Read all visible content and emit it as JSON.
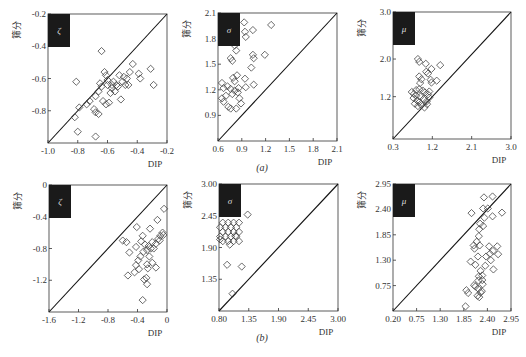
{
  "figure": {
    "row_labels": [
      "(a)",
      "(b)"
    ],
    "y_label": "筛分",
    "x_label": "DIP",
    "colors": {
      "axis": "#333333",
      "marker": "#444444",
      "badge": "#1a1a1a",
      "badge_text": "#dddddd",
      "diagonal": "#111111"
    }
  },
  "chart_data": [
    {
      "type": "scatter",
      "row": "a",
      "param": "ζ",
      "title": "ζ",
      "xlabel": "DIP",
      "ylabel": "筛分",
      "xlim": [
        -1.0,
        -0.2
      ],
      "ylim": [
        -1.0,
        -0.2
      ],
      "xticks": [
        "-1.0",
        "-0.8",
        "-0.6",
        "-0.4",
        "-0.2"
      ],
      "yticks": [
        "-0.2",
        "-0.4",
        "-0.6",
        "-0.8"
      ],
      "ytick_values": [
        -0.2,
        -0.4,
        -0.6,
        -0.8
      ],
      "xtick_values": [
        -1.0,
        -0.8,
        -0.6,
        -0.4,
        -0.2
      ],
      "diagonal": true,
      "frame": {
        "x": 48,
        "y": 14,
        "w": 119,
        "h": 129
      },
      "points": [
        [
          -0.81,
          -0.62
        ],
        [
          -0.64,
          -0.43
        ],
        [
          -0.82,
          -0.84
        ],
        [
          -0.79,
          -0.78
        ],
        [
          -0.8,
          -0.93
        ],
        [
          -0.74,
          -0.76
        ],
        [
          -0.72,
          -0.74
        ],
        [
          -0.69,
          -0.79
        ],
        [
          -0.68,
          -0.81
        ],
        [
          -0.66,
          -0.82
        ],
        [
          -0.68,
          -0.96
        ],
        [
          -0.68,
          -0.71
        ],
        [
          -0.66,
          -0.68
        ],
        [
          -0.65,
          -0.63
        ],
        [
          -0.64,
          -0.65
        ],
        [
          -0.63,
          -0.74
        ],
        [
          -0.62,
          -0.56
        ],
        [
          -0.61,
          -0.58
        ],
        [
          -0.6,
          -0.61
        ],
        [
          -0.6,
          -0.64
        ],
        [
          -0.59,
          -0.75
        ],
        [
          -0.61,
          -0.76
        ],
        [
          -0.58,
          -0.69
        ],
        [
          -0.57,
          -0.66
        ],
        [
          -0.56,
          -0.62
        ],
        [
          -0.55,
          -0.68
        ],
        [
          -0.54,
          -0.64
        ],
        [
          -0.52,
          -0.58
        ],
        [
          -0.51,
          -0.73
        ],
        [
          -0.5,
          -0.62
        ],
        [
          -0.49,
          -0.59
        ],
        [
          -0.48,
          -0.64
        ],
        [
          -0.47,
          -0.6
        ],
        [
          -0.46,
          -0.64
        ],
        [
          -0.45,
          -0.56
        ],
        [
          -0.43,
          -0.51
        ],
        [
          -0.39,
          -0.57
        ],
        [
          -0.38,
          -0.6
        ],
        [
          -0.31,
          -0.54
        ],
        [
          -0.29,
          -0.64
        ],
        [
          -0.57,
          -0.64
        ],
        [
          -0.53,
          -0.65
        ]
      ]
    },
    {
      "type": "scatter",
      "row": "a",
      "param": "σ",
      "title": "σ",
      "xlabel": "DIP",
      "ylabel": "筛分",
      "xlim": [
        0.6,
        2.1
      ],
      "ylim": [
        0.6,
        2.1
      ],
      "xticks": [
        "0.6",
        "0.9",
        "1.2",
        "1.5",
        "1.8",
        "2.1"
      ],
      "yticks": [
        "2.1",
        "1.8",
        "1.5",
        "1.2",
        "0.9"
      ],
      "ytick_values": [
        2.1,
        1.8,
        1.5,
        1.2,
        0.9
      ],
      "xtick_values": [
        0.6,
        0.9,
        1.2,
        1.5,
        1.8,
        2.1
      ],
      "diagonal": true,
      "frame": {
        "x": 218,
        "y": 13,
        "w": 119,
        "h": 128
      },
      "points": [
        [
          0.93,
          1.99
        ],
        [
          0.94,
          1.88
        ],
        [
          0.95,
          1.82
        ],
        [
          1.04,
          1.9
        ],
        [
          1.27,
          1.96
        ],
        [
          0.81,
          1.72
        ],
        [
          0.83,
          1.66
        ],
        [
          0.76,
          1.57
        ],
        [
          0.78,
          1.54
        ],
        [
          1.04,
          1.61
        ],
        [
          1.05,
          1.57
        ],
        [
          1.19,
          1.61
        ],
        [
          1.02,
          1.46
        ],
        [
          0.65,
          1.28
        ],
        [
          0.67,
          1.22
        ],
        [
          0.72,
          1.24
        ],
        [
          0.76,
          1.21
        ],
        [
          0.79,
          1.34
        ],
        [
          0.81,
          1.3
        ],
        [
          0.84,
          1.37
        ],
        [
          0.81,
          1.19
        ],
        [
          0.85,
          1.17
        ],
        [
          0.94,
          1.33
        ],
        [
          1.05,
          1.26
        ],
        [
          0.95,
          1.23
        ],
        [
          0.65,
          1.1
        ],
        [
          0.67,
          1.06
        ],
        [
          0.7,
          1.13
        ],
        [
          0.73,
          1.0
        ],
        [
          0.76,
          0.98
        ],
        [
          0.83,
          0.98
        ],
        [
          0.87,
          1.1
        ],
        [
          0.89,
          1.04
        ],
        [
          0.78,
          1.15
        ],
        [
          0.86,
          1.22
        ]
      ]
    },
    {
      "type": "scatter",
      "row": "a",
      "param": "μ",
      "title": "μ",
      "xlabel": "DIP",
      "ylabel": "筛分",
      "xlim": [
        0.3,
        3.0
      ],
      "ylim": [
        0.3,
        3.0
      ],
      "xticks": [
        "0.3",
        "1.2",
        "2.1",
        "3.0"
      ],
      "yticks": [
        "3.0",
        "2.0",
        "1.2"
      ],
      "ytick_values": [
        3.0,
        2.0,
        1.2
      ],
      "xtick_values": [
        0.3,
        1.2,
        2.1,
        3.0
      ],
      "diagonal": true,
      "frame": {
        "x": 393,
        "y": 12,
        "w": 118,
        "h": 127
      },
      "points": [
        [
          0.87,
          2.0
        ],
        [
          0.9,
          1.94
        ],
        [
          1.05,
          1.9
        ],
        [
          1.18,
          1.79
        ],
        [
          1.38,
          1.87
        ],
        [
          1.06,
          1.73
        ],
        [
          1.1,
          1.69
        ],
        [
          0.9,
          1.63
        ],
        [
          0.95,
          1.57
        ],
        [
          0.92,
          1.49
        ],
        [
          1.16,
          1.56
        ],
        [
          1.18,
          1.5
        ],
        [
          1.3,
          1.54
        ],
        [
          0.73,
          1.3
        ],
        [
          0.78,
          1.26
        ],
        [
          0.83,
          1.34
        ],
        [
          0.9,
          1.36
        ],
        [
          0.98,
          1.33
        ],
        [
          1.03,
          1.29
        ],
        [
          1.1,
          1.25
        ],
        [
          1.13,
          1.31
        ],
        [
          0.77,
          1.17
        ],
        [
          0.85,
          1.12
        ],
        [
          0.93,
          1.2
        ],
        [
          1.0,
          1.15
        ],
        [
          1.07,
          1.1
        ],
        [
          1.13,
          1.18
        ],
        [
          0.8,
          1.05
        ],
        [
          0.87,
          1.0
        ],
        [
          0.95,
          1.02
        ],
        [
          1.02,
          0.97
        ],
        [
          1.08,
          1.04
        ],
        [
          0.9,
          1.08
        ],
        [
          0.83,
          1.22
        ]
      ]
    },
    {
      "type": "scatter",
      "row": "b",
      "param": "ζ",
      "title": "ζ",
      "xlabel": "DIP",
      "ylabel": "筛分",
      "xlim": [
        -1.6,
        0
      ],
      "ylim": [
        -1.6,
        0
      ],
      "xticks": [
        "-1.6",
        "-1.2",
        "-0.8",
        "-0.4",
        "0"
      ],
      "yticks": [
        "0",
        "-0.4",
        "-0.8",
        "-1.2"
      ],
      "ytick_values": [
        0,
        -0.4,
        -0.8,
        -1.2
      ],
      "xtick_values": [
        -1.6,
        -1.2,
        -0.8,
        -0.4,
        0
      ],
      "diagonal": true,
      "frame": {
        "x": 49,
        "y": 185,
        "w": 118,
        "h": 127
      },
      "points": [
        [
          -0.04,
          -0.3
        ],
        [
          -0.13,
          -0.44
        ],
        [
          -0.41,
          -0.53
        ],
        [
          -0.23,
          -0.55
        ],
        [
          -0.6,
          -0.7
        ],
        [
          -0.55,
          -0.72
        ],
        [
          -0.51,
          -0.85
        ],
        [
          -0.42,
          -0.78
        ],
        [
          -0.33,
          -0.64
        ],
        [
          -0.35,
          -0.71
        ],
        [
          -0.3,
          -0.75
        ],
        [
          -0.27,
          -0.82
        ],
        [
          -0.25,
          -0.77
        ],
        [
          -0.2,
          -0.72
        ],
        [
          -0.18,
          -0.8
        ],
        [
          -0.15,
          -0.74
        ],
        [
          -0.12,
          -0.68
        ],
        [
          -0.09,
          -0.64
        ],
        [
          -0.06,
          -0.6
        ],
        [
          -0.05,
          -0.63
        ],
        [
          -0.1,
          -0.7
        ],
        [
          -0.22,
          -0.8
        ],
        [
          -0.32,
          -0.84
        ],
        [
          -0.39,
          -0.95
        ],
        [
          -0.42,
          -1.01
        ],
        [
          -0.44,
          -1.1
        ],
        [
          -0.38,
          -1.06
        ],
        [
          -0.27,
          -1.0
        ],
        [
          -0.26,
          -1.05
        ],
        [
          -0.2,
          -0.98
        ],
        [
          -0.15,
          -1.04
        ],
        [
          -0.53,
          -1.14
        ],
        [
          -0.31,
          -1.19
        ],
        [
          -0.28,
          -1.17
        ],
        [
          -0.27,
          -1.25
        ],
        [
          -0.33,
          -1.45
        ],
        [
          -0.36,
          -0.9
        ],
        [
          -0.24,
          -0.9
        ]
      ]
    },
    {
      "type": "scatter",
      "row": "b",
      "param": "σ",
      "title": "σ",
      "xlabel": "DIP",
      "ylabel": "筛分",
      "xlim": [
        0.8,
        3.0
      ],
      "ylim": [
        0.8,
        3.0
      ],
      "xticks": [
        "0.80",
        "1.35",
        "1.90",
        "2.45",
        "3.00"
      ],
      "yticks": [
        "3.00",
        "2.45",
        "1.90",
        "1.35"
      ],
      "ytick_values": [
        3.0,
        2.45,
        1.9,
        1.35
      ],
      "xtick_values": [
        0.8,
        1.35,
        1.9,
        2.45,
        3.0
      ],
      "diagonal": true,
      "frame": {
        "x": 219,
        "y": 184,
        "w": 119,
        "h": 127
      },
      "points": [
        [
          1.33,
          2.47
        ],
        [
          0.87,
          2.33
        ],
        [
          0.97,
          2.33
        ],
        [
          1.07,
          2.33
        ],
        [
          1.17,
          2.33
        ],
        [
          0.82,
          2.25
        ],
        [
          0.92,
          2.25
        ],
        [
          1.02,
          2.25
        ],
        [
          1.12,
          2.25
        ],
        [
          0.87,
          2.17
        ],
        [
          0.97,
          2.17
        ],
        [
          1.07,
          2.17
        ],
        [
          1.17,
          2.17
        ],
        [
          0.82,
          2.09
        ],
        [
          0.92,
          2.09
        ],
        [
          1.02,
          2.09
        ],
        [
          1.12,
          2.09
        ],
        [
          0.87,
          2.01
        ],
        [
          0.97,
          2.01
        ],
        [
          1.07,
          2.01
        ],
        [
          1.17,
          2.01
        ],
        [
          0.82,
          2.04
        ],
        [
          1.0,
          1.95
        ],
        [
          0.95,
          1.6
        ],
        [
          1.22,
          1.57
        ],
        [
          1.05,
          1.1
        ],
        [
          1.1,
          2.1
        ]
      ]
    },
    {
      "type": "scatter",
      "row": "b",
      "param": "μ",
      "title": "μ",
      "xlabel": "DIP",
      "ylabel": "筛分",
      "xlim": [
        0.2,
        2.95
      ],
      "ylim": [
        0.2,
        2.95
      ],
      "xticks": [
        "0.20",
        "0.75",
        "1.30",
        "1.85",
        "2.40",
        "2.95"
      ],
      "yticks": [
        "2.95",
        "2.40",
        "1.85",
        "1.30",
        "0.75"
      ],
      "ytick_values": [
        2.95,
        2.4,
        1.85,
        1.3,
        0.75
      ],
      "xtick_values": [
        0.2,
        0.75,
        1.3,
        1.85,
        2.4,
        2.95
      ],
      "diagonal": true,
      "frame": {
        "x": 393,
        "y": 184,
        "w": 118,
        "h": 127
      },
      "points": [
        [
          2.32,
          2.66
        ],
        [
          2.52,
          2.68
        ],
        [
          2.3,
          2.42
        ],
        [
          2.41,
          2.42
        ],
        [
          2.03,
          2.32
        ],
        [
          2.74,
          2.33
        ],
        [
          2.33,
          2.22
        ],
        [
          2.52,
          2.25
        ],
        [
          2.23,
          2.09
        ],
        [
          2.3,
          2.04
        ],
        [
          2.21,
          1.97
        ],
        [
          2.2,
          1.82
        ],
        [
          2.15,
          1.7
        ],
        [
          2.22,
          1.62
        ],
        [
          2.08,
          1.62
        ],
        [
          2.44,
          1.6
        ],
        [
          2.63,
          1.6
        ],
        [
          2.1,
          1.55
        ],
        [
          2.46,
          1.44
        ],
        [
          2.53,
          1.5
        ],
        [
          2.65,
          1.43
        ],
        [
          2.18,
          1.38
        ],
        [
          2.37,
          1.38
        ],
        [
          2.48,
          1.3
        ],
        [
          2.01,
          1.27
        ],
        [
          2.12,
          1.2
        ],
        [
          2.35,
          1.18
        ],
        [
          2.54,
          1.1
        ],
        [
          2.24,
          1.07
        ],
        [
          2.28,
          0.97
        ],
        [
          2.2,
          0.95
        ],
        [
          2.28,
          0.87
        ],
        [
          2.29,
          0.78
        ],
        [
          2.12,
          0.73
        ],
        [
          2.19,
          0.68
        ],
        [
          2.24,
          0.6
        ],
        [
          1.91,
          0.65
        ],
        [
          1.95,
          0.59
        ],
        [
          2.17,
          0.53
        ],
        [
          2.21,
          0.5
        ],
        [
          1.89,
          0.3
        ],
        [
          2.09,
          0.76
        ],
        [
          2.27,
          0.63
        ],
        [
          2.19,
          0.86
        ]
      ]
    }
  ]
}
